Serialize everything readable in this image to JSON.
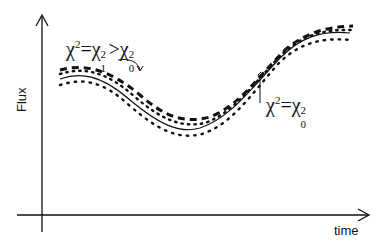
{
  "diagram": {
    "type": "light-curve fit illustration",
    "axes": {
      "y_label": "Flux",
      "x_label": "time"
    },
    "annotations": {
      "upper_left": {
        "chi": "χ",
        "eq": "=",
        "gt": ">",
        "sup": "2",
        "sub1": "1",
        "sub0": "0"
      },
      "right": {
        "chi": "χ",
        "eq": "=",
        "sup": "2",
        "sub0": "0"
      }
    },
    "curves": [
      {
        "name": "data-points",
        "style": "dotted"
      },
      {
        "name": "best-fit model",
        "style": "solid",
        "chi2": "χ²=χ₀²"
      },
      {
        "name": "alternative model",
        "style": "dashed",
        "chi2": "χ²=χ₁²>χ₀²"
      }
    ],
    "colors": {
      "line": "#111111",
      "background": "#ffffff"
    }
  }
}
